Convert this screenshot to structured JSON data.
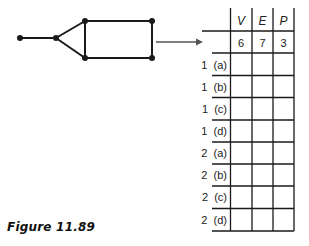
{
  "graph": {
    "vertices": [
      {
        "id": "v1",
        "x": 20,
        "y": 38
      },
      {
        "id": "v2",
        "x": 56,
        "y": 38
      },
      {
        "id": "v3",
        "x": 85,
        "y": 21
      },
      {
        "id": "v4",
        "x": 152,
        "y": 21
      },
      {
        "id": "v5",
        "x": 85,
        "y": 58
      },
      {
        "id": "v6",
        "x": 152,
        "y": 58
      }
    ],
    "edges": [
      [
        "v1",
        "v2"
      ],
      [
        "v2",
        "v3"
      ],
      [
        "v2",
        "v5"
      ],
      [
        "v3",
        "v5"
      ],
      [
        "v3",
        "v4"
      ],
      [
        "v5",
        "v6"
      ],
      [
        "v4",
        "v6"
      ]
    ]
  },
  "table": {
    "headers": [
      "V",
      "E",
      "P"
    ],
    "values_row": [
      "6",
      "7",
      "3"
    ],
    "rows": [
      {
        "label": "1  (a)",
        "cells": [
          "",
          "",
          ""
        ]
      },
      {
        "label": "1  (b)",
        "cells": [
          "",
          "",
          ""
        ]
      },
      {
        "label": "1  (c)",
        "cells": [
          "",
          "",
          ""
        ]
      },
      {
        "label": "1  (d)",
        "cells": [
          "",
          "",
          ""
        ]
      },
      {
        "label": "2  (a)",
        "cells": [
          "",
          "",
          ""
        ]
      },
      {
        "label": "2  (b)",
        "cells": [
          "",
          "",
          ""
        ]
      },
      {
        "label": "2  (c)",
        "cells": [
          "",
          "",
          ""
        ]
      },
      {
        "label": "2  (d)",
        "cells": [
          "",
          "",
          ""
        ]
      }
    ]
  },
  "caption": "Figure 11.89",
  "colors": {
    "line": "#1a1a1a",
    "arrow": "#555555"
  }
}
